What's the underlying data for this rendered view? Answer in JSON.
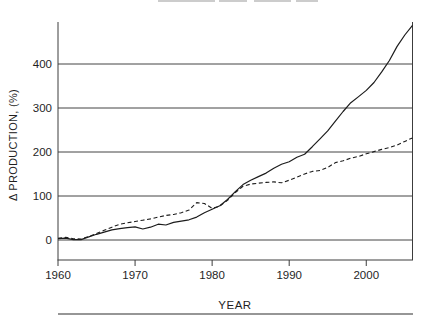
{
  "figure": {
    "x_axis_title": "YEAR",
    "y_axis_title": "Δ PRODUCTION, (%)"
  },
  "artifacts": {
    "top_cropped_text_segments": [
      [
        158,
        57
      ],
      [
        219,
        28
      ],
      [
        254,
        37
      ],
      [
        296,
        22
      ]
    ]
  },
  "chart_data": {
    "type": "line",
    "title": "",
    "xlabel": "YEAR",
    "ylabel": "Δ PRODUCTION, (%)",
    "xlim": [
      1960,
      2006
    ],
    "ylim": [
      0,
      495
    ],
    "x_ticks": [
      1960,
      1970,
      1980,
      1990,
      2000
    ],
    "y_ticks": [
      0,
      100,
      200,
      300,
      400
    ],
    "grid": "horizontal-only",
    "legend": "none",
    "x": [
      1960,
      1961,
      1962,
      1963,
      1964,
      1965,
      1966,
      1967,
      1968,
      1969,
      1970,
      1971,
      1972,
      1973,
      1974,
      1975,
      1976,
      1977,
      1978,
      1979,
      1980,
      1981,
      1982,
      1983,
      1984,
      1985,
      1986,
      1987,
      1988,
      1989,
      1990,
      1991,
      1992,
      1993,
      1994,
      1995,
      1996,
      1997,
      1998,
      1999,
      2000,
      2001,
      2002,
      2003,
      2004,
      2005,
      2006
    ],
    "series": [
      {
        "name": "solid-line-series",
        "style": "solid",
        "color": "#1c1c1c",
        "values": [
          3,
          4,
          1,
          1,
          7,
          13,
          18,
          23,
          26,
          28,
          30,
          25,
          29,
          36,
          34,
          40,
          43,
          46,
          52,
          62,
          70,
          78,
          92,
          110,
          126,
          136,
          144,
          152,
          163,
          172,
          178,
          188,
          195,
          212,
          230,
          248,
          270,
          292,
          312,
          326,
          340,
          358,
          382,
          408,
          440,
          466,
          488
        ]
      },
      {
        "name": "dashed-line-series",
        "style": "dashed",
        "color": "#1c1c1c",
        "values": [
          4,
          6,
          3,
          2,
          8,
          15,
          22,
          29,
          36,
          39,
          42,
          45,
          48,
          52,
          56,
          58,
          62,
          68,
          85,
          83,
          72,
          77,
          90,
          108,
          122,
          127,
          129,
          131,
          132,
          130,
          136,
          143,
          150,
          156,
          158,
          165,
          176,
          180,
          186,
          190,
          196,
          201,
          206,
          210,
          216,
          224,
          232
        ]
      }
    ]
  }
}
